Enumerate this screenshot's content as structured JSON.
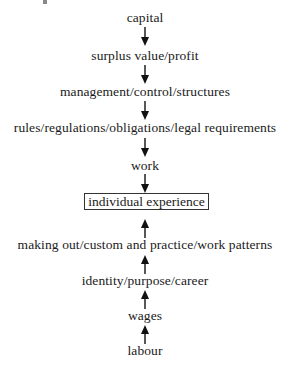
{
  "diagram": {
    "type": "flow",
    "top_chain": [
      {
        "label": "capital"
      },
      {
        "label": "surplus value/profit"
      },
      {
        "label": "management/control/structures"
      },
      {
        "label": "rules/regulations/obligations/legal requirements"
      },
      {
        "label": "work"
      }
    ],
    "center": {
      "label": "individual experience",
      "boxed": true
    },
    "bottom_chain": [
      {
        "label": "making out/custom and practice/work patterns"
      },
      {
        "label": "identity/purpose/career"
      },
      {
        "label": "wages"
      },
      {
        "label": "labour"
      }
    ],
    "arrows": {
      "top": "down-arrow-icon",
      "bottom": "up-arrow-icon"
    },
    "colors": {
      "text": "#1a1a1a",
      "box_border": "#333333",
      "background": "#ffffff"
    }
  }
}
